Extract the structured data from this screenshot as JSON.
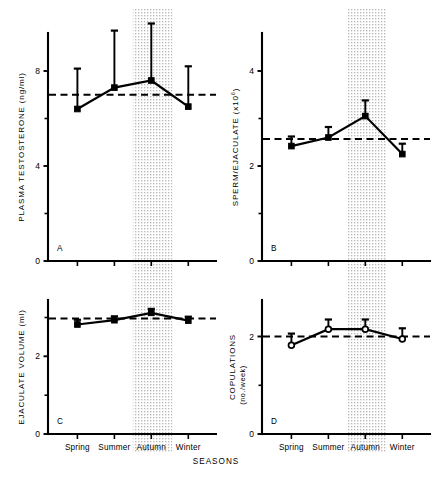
{
  "figure": {
    "xaxis_title": "SEASONS",
    "categories": [
      "Spring",
      "Summer",
      "Autumn",
      "Winter"
    ],
    "highlight_band": "Autumn"
  },
  "chart_data": [
    {
      "type": "line",
      "panel": "A",
      "title": "",
      "ylabel": "PLASMA TESTOSTERONE (ng/ml)",
      "ylabel_main": "PLASMA TESTOSTERONE",
      "ylabel_unit": "(ng/ml)",
      "xlabel": "SEASONS",
      "categories": [
        "Spring",
        "Summer",
        "Autumn",
        "Winter"
      ],
      "values": [
        6.4,
        7.3,
        7.6,
        6.5
      ],
      "errors": [
        1.7,
        2.4,
        2.4,
        1.7
      ],
      "mean_line": 7.0,
      "ylim": [
        0,
        9.6
      ],
      "yticks_major": [
        0,
        4,
        8
      ],
      "yticks_minor": [
        2,
        6
      ],
      "ytick_labels": [
        "0",
        "4",
        "8"
      ],
      "marker": "filled-square",
      "grid": false,
      "legend": "none",
      "shaded_season": "Autumn"
    },
    {
      "type": "line",
      "panel": "B",
      "title": "",
      "ylabel": "SPERM/EJACULATE (x10⁶)",
      "ylabel_main": "SPERM/EJACULATE (x10",
      "ylabel_exponent": "6",
      "ylabel_close": ")",
      "xlabel": "SEASONS",
      "categories": [
        "Spring",
        "Summer",
        "Autumn",
        "Winter"
      ],
      "values": [
        2.42,
        2.6,
        3.05,
        2.25
      ],
      "errors": [
        0.2,
        0.22,
        0.33,
        0.22
      ],
      "mean_line": 2.57,
      "ylim": [
        0,
        4.8
      ],
      "yticks_major": [
        0,
        2,
        4
      ],
      "yticks_minor": [
        1,
        3
      ],
      "ytick_labels": [
        "0",
        "2",
        "4"
      ],
      "marker": "filled-square",
      "grid": false,
      "legend": "none",
      "shaded_season": "Autumn"
    },
    {
      "type": "line",
      "panel": "C",
      "title": "",
      "ylabel": "EJACULATE VOLUME (ml)",
      "ylabel_main": "EJACULATE VOLUME",
      "ylabel_unit": "(ml)",
      "xlabel": "SEASONS",
      "categories": [
        "Spring",
        "Summer",
        "Autumn",
        "Winter"
      ],
      "values": [
        2.82,
        2.93,
        3.12,
        2.92
      ],
      "errors": [
        0.12,
        0.1,
        0.1,
        0.1
      ],
      "mean_line": 2.97,
      "ylim": [
        0,
        3.45
      ],
      "yticks_major": [
        0,
        2
      ],
      "yticks_minor": [
        1,
        3
      ],
      "ytick_labels": [
        "0",
        "2"
      ],
      "marker": "filled-square",
      "grid": false,
      "legend": "none",
      "shaded_season": "Autumn"
    },
    {
      "type": "line",
      "panel": "D",
      "title": "",
      "ylabel": "COPULATIONS (no./week)",
      "ylabel_main": "COPULATIONS",
      "ylabel_unit": "(no./week)",
      "xlabel": "SEASONS",
      "categories": [
        "Spring",
        "Summer",
        "Autumn",
        "Winter"
      ],
      "values": [
        1.82,
        2.15,
        2.15,
        1.95
      ],
      "errors": [
        0.24,
        0.2,
        0.2,
        0.22
      ],
      "mean_line": 2.0,
      "ylim": [
        0,
        2.75
      ],
      "yticks_major": [
        0,
        2
      ],
      "yticks_minor": [
        1
      ],
      "ytick_labels": [
        "0",
        "2"
      ],
      "marker": "open-circle",
      "grid": false,
      "legend": "none",
      "shaded_season": "Autumn"
    }
  ]
}
